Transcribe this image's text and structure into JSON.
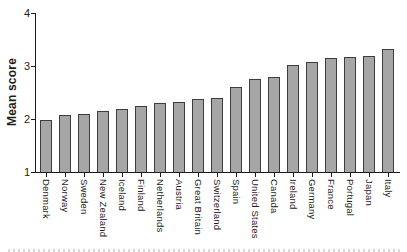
{
  "chart_data": {
    "type": "bar",
    "title": "",
    "xlabel": "",
    "ylabel": "Mean score",
    "categories": [
      "Denmark",
      "Norway",
      "Sweden",
      "New Zealand",
      "Iceland",
      "Finland",
      "Netherlands",
      "Austria",
      "Great Britain",
      "Switzerland",
      "Spain",
      "United States",
      "Canada",
      "Ireland",
      "Germany",
      "France",
      "Portugal",
      "Japan",
      "Italy"
    ],
    "values": [
      1.98,
      2.07,
      2.09,
      2.15,
      2.19,
      2.24,
      2.3,
      2.32,
      2.38,
      2.4,
      2.6,
      2.75,
      2.79,
      3.01,
      3.08,
      3.15,
      3.17,
      3.19,
      3.32
    ],
    "ylim": [
      1,
      4
    ],
    "yticks": [
      1,
      2,
      3,
      4
    ],
    "grid": false,
    "legend": null,
    "bar_orientation": "vertical",
    "colors": {
      "bar_fill": "#a6a6a6",
      "bar_border": "#3d3d3d",
      "axis": "#1c1c1c",
      "text": "#1c1c1c"
    }
  }
}
